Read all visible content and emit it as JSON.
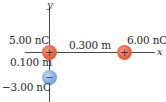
{
  "diagram": {
    "axes": {
      "x_label": "x",
      "y_label": "y"
    },
    "charges": [
      {
        "id": "q1",
        "value_label": "5.00 nC",
        "sign": "+",
        "position": "origin",
        "color": "#e0583e"
      },
      {
        "id": "q2",
        "value_label": "6.00 nC",
        "sign": "+",
        "position": "on x-axis",
        "color": "#e0583e"
      },
      {
        "id": "q3",
        "value_label": "−3.00 nC",
        "sign": "−",
        "position": "on negative y-axis",
        "color": "#7aa3d8"
      }
    ],
    "distances": [
      {
        "id": "d_x",
        "label": "0.300 m"
      },
      {
        "id": "d_y",
        "label": "0.100 m"
      }
    ]
  }
}
